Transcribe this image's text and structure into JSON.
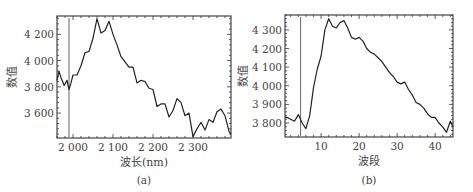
{
  "chart_data": [
    {
      "id": "a",
      "type": "line",
      "caption": "(a)",
      "xlabel": "波长(nm)",
      "ylabel": "数值",
      "xlim": [
        1960,
        2395
      ],
      "ylim": [
        3410,
        4340
      ],
      "xticks": [
        2000,
        2100,
        2200,
        2300
      ],
      "xtick_labels": [
        "2 000",
        "2 100",
        "2 200",
        "2 300"
      ],
      "yticks": [
        3600,
        3800,
        4000,
        4200
      ],
      "ytick_labels": [
        "3 600",
        "3 800",
        "4 000",
        "4 200"
      ],
      "vertical_marker_x": 1990,
      "grid": false,
      "x": [
        1960,
        1965,
        1970,
        1978,
        1985,
        1990,
        1995,
        2000,
        2010,
        2020,
        2030,
        2040,
        2050,
        2060,
        2070,
        2080,
        2090,
        2100,
        2110,
        2120,
        2130,
        2140,
        2150,
        2160,
        2170,
        2180,
        2190,
        2200,
        2210,
        2220,
        2230,
        2240,
        2250,
        2260,
        2270,
        2280,
        2290,
        2300,
        2310,
        2320,
        2330,
        2340,
        2350,
        2360,
        2370,
        2380,
        2390,
        2395
      ],
      "values": [
        3850,
        3920,
        3870,
        3810,
        3850,
        3780,
        3830,
        3890,
        3890,
        3960,
        4060,
        4070,
        4170,
        4320,
        4210,
        4230,
        4300,
        4200,
        4120,
        4030,
        3990,
        3950,
        3950,
        3830,
        3850,
        3840,
        3790,
        3780,
        3650,
        3670,
        3670,
        3570,
        3620,
        3710,
        3680,
        3580,
        3600,
        3420,
        3480,
        3530,
        3470,
        3550,
        3530,
        3610,
        3630,
        3580,
        3460,
        3440
      ]
    },
    {
      "id": "b",
      "type": "line",
      "caption": "(b)",
      "xlabel": "波段",
      "ylabel": "数值",
      "xlim": [
        0.5,
        44.7
      ],
      "ylim": [
        3725,
        4380
      ],
      "xticks": [
        10,
        20,
        30,
        40
      ],
      "xtick_labels": [
        "10",
        "20",
        "30",
        "40"
      ],
      "yticks": [
        3800,
        3900,
        4000,
        4100,
        4200,
        4300
      ],
      "ytick_labels": [
        "3 800",
        "3 900",
        "4 000",
        "4 100",
        "4 200",
        "4 300"
      ],
      "vertical_marker_x": 4.6,
      "grid": false,
      "x": [
        0.5,
        1,
        2,
        3,
        4,
        5,
        6,
        7,
        8,
        9,
        10,
        11,
        12,
        13,
        14,
        15,
        16,
        17,
        18,
        19,
        20,
        21,
        22,
        23,
        24,
        25,
        26,
        27,
        28,
        29,
        30,
        31,
        32,
        33,
        34,
        35,
        36,
        37,
        38,
        39,
        40,
        41,
        42,
        43,
        44,
        44.7
      ],
      "values": [
        3830,
        3830,
        3820,
        3810,
        3845,
        3800,
        3770,
        3840,
        3990,
        4090,
        4160,
        4300,
        4360,
        4320,
        4310,
        4340,
        4350,
        4310,
        4260,
        4250,
        4260,
        4240,
        4200,
        4180,
        4170,
        4150,
        4130,
        4100,
        4070,
        4050,
        4020,
        4010,
        4020,
        3980,
        3950,
        3910,
        3900,
        3880,
        3850,
        3830,
        3830,
        3800,
        3780,
        3750,
        3810,
        3780
      ]
    }
  ]
}
